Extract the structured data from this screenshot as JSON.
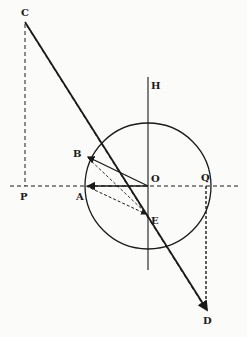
{
  "diagram": {
    "type": "geometry",
    "colors": {
      "ink": "#1a1a1a",
      "paper": "#fbfbf9"
    },
    "circle": {
      "center": "O",
      "cx": 148,
      "cy": 186,
      "r": 63
    },
    "points": {
      "C": {
        "label": "C",
        "x": 25,
        "y": 22
      },
      "H": {
        "label": "H",
        "x": 148,
        "y": 77
      },
      "B": {
        "label": "B",
        "x": 86,
        "y": 156
      },
      "O": {
        "label": "O",
        "x": 148,
        "y": 186
      },
      "Q": {
        "label": "Q",
        "x": 206,
        "y": 186
      },
      "P": {
        "label": "P",
        "x": 25,
        "y": 186
      },
      "A": {
        "label": "A",
        "x": 86,
        "y": 186
      },
      "E": {
        "label": "E",
        "x": 148,
        "y": 215
      },
      "D": {
        "label": "D",
        "x": 207,
        "y": 312
      }
    },
    "segments": [
      {
        "from": "C",
        "to": "D",
        "style": "solid",
        "desc": "line C-O-D"
      },
      {
        "from": "H",
        "to": "axis-bottom",
        "style": "solid",
        "desc": "vertical axis through O"
      },
      {
        "from": "O",
        "to": "B",
        "style": "solid",
        "arrow": "B"
      },
      {
        "from": "O",
        "to": "A",
        "style": "solid",
        "arrow": "A"
      },
      {
        "from": "C",
        "to": "P",
        "style": "dashed"
      },
      {
        "from": "left",
        "to": "right",
        "style": "dashed",
        "desc": "horizontal axis through O"
      },
      {
        "from": "C",
        "to": "D",
        "style": "dashed",
        "desc": "via B"
      },
      {
        "from": "A",
        "to": "E",
        "style": "dashed",
        "arrow": "E"
      },
      {
        "from": "B",
        "to": "E",
        "style": "dashed"
      },
      {
        "from": "Q",
        "to": "D",
        "style": "dashed"
      }
    ]
  }
}
